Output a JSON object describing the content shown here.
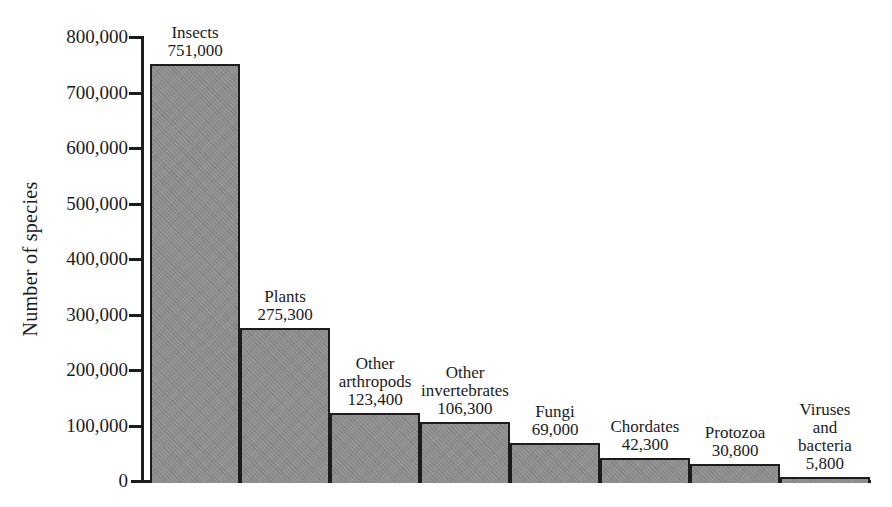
{
  "figure": {
    "background_color": "#ffffff",
    "text_color": "#1b1b1b",
    "axis_color": "#1c1c1c"
  },
  "chart_data": {
    "type": "bar",
    "title": "",
    "xlabel": "",
    "ylabel": "Number of species",
    "ylim": [
      0,
      800000
    ],
    "ytick_interval": 100000,
    "ytick_labels": [
      "800,000",
      "700,000",
      "600,000",
      "500,000",
      "400,000",
      "300,000",
      "200,000",
      "100,000",
      "0"
    ],
    "grid": false,
    "legend": false,
    "bar_color": "#8d8d8d",
    "bar_border_color": "#1c1c1c",
    "categories": [
      "Insects",
      "Plants",
      "Other arthropods",
      "Other invertebrates",
      "Fungi",
      "Chordates",
      "Protozoa",
      "Viruses and bacteria"
    ],
    "values": [
      751000,
      275300,
      123400,
      106300,
      69000,
      42300,
      30800,
      5800
    ],
    "bars": [
      {
        "label_lines": [
          "Insects"
        ],
        "value": 751000,
        "value_label": "751,000"
      },
      {
        "label_lines": [
          "Plants"
        ],
        "value": 275300,
        "value_label": "275,300"
      },
      {
        "label_lines": [
          "Other",
          "arthropods"
        ],
        "value": 123400,
        "value_label": "123,400"
      },
      {
        "label_lines": [
          "Other",
          "invertebrates"
        ],
        "value": 106300,
        "value_label": "106,300"
      },
      {
        "label_lines": [
          "Fungi"
        ],
        "value": 69000,
        "value_label": "69,000"
      },
      {
        "label_lines": [
          "Chordates"
        ],
        "value": 42300,
        "value_label": "42,300"
      },
      {
        "label_lines": [
          "Protozoa"
        ],
        "value": 30800,
        "value_label": "30,800"
      },
      {
        "label_lines": [
          "Viruses",
          "and",
          "bacteria"
        ],
        "value": 5800,
        "value_label": "5,800"
      }
    ]
  }
}
